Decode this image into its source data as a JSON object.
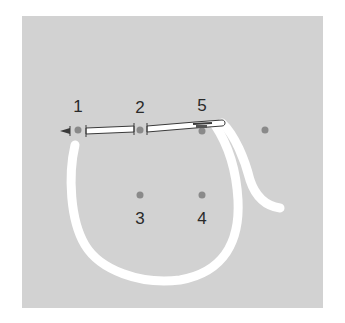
{
  "diagram": {
    "type": "embroidery-stitch-instruction",
    "colors": {
      "fabric": "#d2d2d2",
      "background": "#ffffff",
      "thread": "#ffffff",
      "hole_dot": "#8a8a8a",
      "needle_outline": "#3a3a3a",
      "label": "#2a2a2a"
    },
    "points": [
      {
        "id": "1",
        "label": "1",
        "x": 78,
        "y": 130,
        "label_x": 78,
        "label_y": 100
      },
      {
        "id": "2",
        "label": "2",
        "x": 140,
        "y": 130,
        "label_x": 140,
        "label_y": 101
      },
      {
        "id": "5",
        "label": "5",
        "x": 202,
        "y": 130,
        "label_x": 202,
        "label_y": 99
      },
      {
        "id": "extra",
        "label": "",
        "x": 265,
        "y": 130
      },
      {
        "id": "3",
        "label": "3",
        "x": 140,
        "y": 195,
        "label_x": 140,
        "label_y": 209
      },
      {
        "id": "4",
        "label": "4",
        "x": 202,
        "y": 195,
        "label_x": 202,
        "label_y": 209
      }
    ],
    "labels": {
      "p1": "1",
      "p2": "2",
      "p3": "3",
      "p4": "4",
      "p5": "5"
    },
    "needle": {
      "from_point": "1",
      "through_point": "2",
      "eye_near_point": "5",
      "direction": "right-to-left"
    }
  }
}
